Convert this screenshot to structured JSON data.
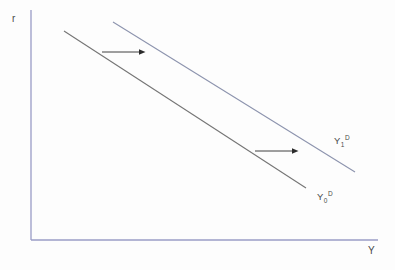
{
  "colors": {
    "background": "#fdfdfd",
    "axis": "#9a9cc6",
    "curve0": "#757575",
    "curve1": "#8d94ae",
    "arrow": "#2b2b2b",
    "text": "#4a4a4a"
  },
  "axes": {
    "y_label": "r",
    "x_label": "Y",
    "origin": {
      "x": 31,
      "y": 240
    },
    "y_top": 10,
    "x_right": 378
  },
  "curves": [
    {
      "id": "initial-demand",
      "label_base": "Y",
      "label_sub": "0",
      "label_sup": "D",
      "x1": 64,
      "y1": 31,
      "x2": 306,
      "y2": 188
    },
    {
      "id": "shifted-demand",
      "label_base": "Y",
      "label_sub": "1",
      "label_sup": "D",
      "x1": 113,
      "y1": 22,
      "x2": 355,
      "y2": 172
    }
  ],
  "arrows": [
    {
      "x1": 102,
      "y1": 52,
      "x2": 139,
      "y2": 52
    },
    {
      "x1": 255,
      "y1": 151,
      "x2": 292,
      "y2": 151
    }
  ]
}
